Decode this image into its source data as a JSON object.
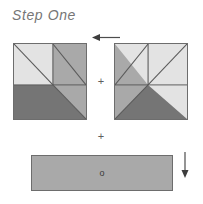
{
  "page": {
    "title": "Step One",
    "width": 203,
    "height": 204,
    "background": "#ffffff"
  },
  "palette": {
    "light": "#e3e3e3",
    "medium": "#a9a9a9",
    "dark": "#757575",
    "outline": "#6d6d6d",
    "title_text": "#767676",
    "symbol_text": "#5e5e5e"
  },
  "diagram": {
    "type": "quilt-block-assembly",
    "operators": {
      "plus_1": "+",
      "plus_2": "+"
    },
    "arrows": [
      {
        "name": "top-direction-arrow",
        "direction": "left"
      },
      {
        "name": "strip-direction-arrow",
        "direction": "down"
      }
    ],
    "blocks": [
      {
        "name": "block-left",
        "label": "Left pieced square",
        "orientation": "normal",
        "patches": [
          {
            "name": "top-left-light-triangle",
            "shade": "light"
          },
          {
            "name": "upper-diagonal-dark-line",
            "shade": "dark"
          },
          {
            "name": "right-medium-triangle",
            "shade": "medium"
          },
          {
            "name": "bottom-dark-band",
            "shade": "dark"
          }
        ]
      },
      {
        "name": "block-right",
        "label": "Right pieced square (mirrored)",
        "orientation": "mirrored",
        "patches": [
          {
            "name": "left-medium-triangle",
            "shade": "medium"
          },
          {
            "name": "top-right-light-triangle",
            "shade": "light"
          },
          {
            "name": "bottom-dark-band",
            "shade": "dark"
          }
        ]
      }
    ],
    "strip": {
      "name": "bottom-strip",
      "label": "Background strip",
      "shade": "medium",
      "marker": "o"
    }
  }
}
